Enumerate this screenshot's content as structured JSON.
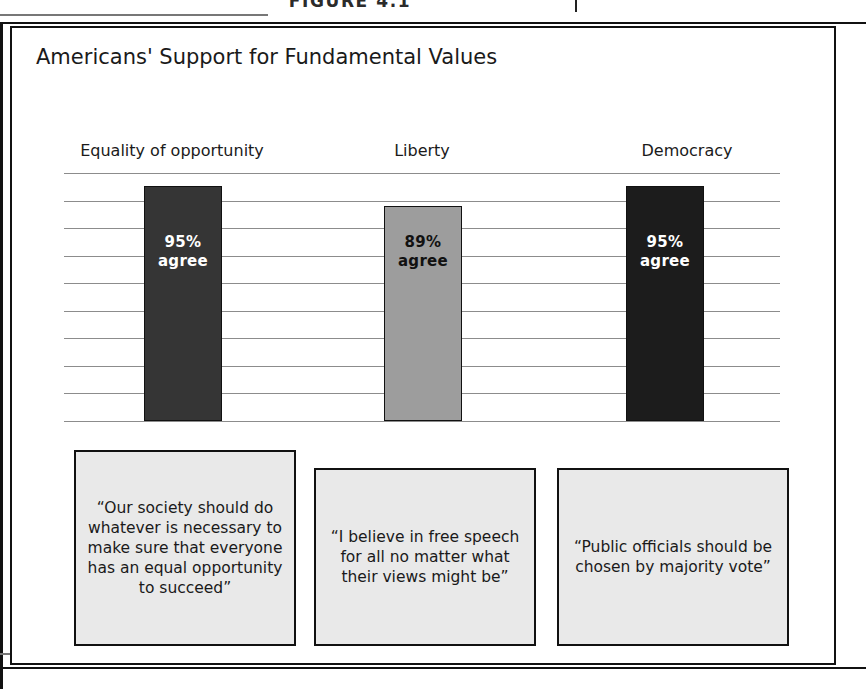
{
  "page": {
    "figure_caption": "FIGURE 4.1",
    "spine_mark": "page-spine-mark"
  },
  "figure": {
    "title": "Americans' Support for Fundamental Values"
  },
  "chart_data": {
    "type": "bar",
    "title": "Americans' Support for Fundamental Values",
    "xlabel": "",
    "ylabel": "",
    "ylim": [
      0,
      100
    ],
    "grid": true,
    "gridline_count": 10,
    "legend": "none",
    "categories": [
      "Equality of opportunity",
      "Liberty",
      "Democracy"
    ],
    "values": [
      95,
      89,
      95
    ],
    "value_labels": [
      "95%",
      "89%",
      "95%"
    ],
    "value_suffix": "agree",
    "bars": [
      {
        "category": "Equality of opportunity",
        "value": 95,
        "value_label": "95%",
        "suffix": "agree",
        "fill": "#353535",
        "text_color": "#ffffff",
        "quote": "“Our society should do whatever is necessary to make sure that everyone has an equal opportunity to succeed”"
      },
      {
        "category": "Liberty",
        "value": 89,
        "value_label": "89%",
        "suffix": "agree",
        "fill": "#9d9d9d",
        "text_color": "#111111",
        "quote": "“I believe in free speech for all no matter what their views might be”"
      },
      {
        "category": "Democracy",
        "value": 95,
        "value_label": "95%",
        "suffix": "agree",
        "fill": "#1c1c1c",
        "text_color": "#ffffff",
        "quote": "“Public officials should be chosen by majority vote”"
      }
    ]
  },
  "colors": {
    "frame": "#111111",
    "gridline": "#8c8c8c",
    "quote_box_fill": "#e9e9e9",
    "bar_dark": "#353535",
    "bar_mid": "#9d9d9d",
    "bar_darkest": "#1c1c1c"
  }
}
